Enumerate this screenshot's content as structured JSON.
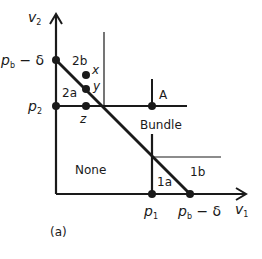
{
  "figure": {
    "caption": "(a)",
    "axes": {
      "x_label": "v",
      "x_label_sub": "1",
      "y_label": "v",
      "y_label_sub": "2"
    },
    "y_ticks": [
      {
        "label": "p",
        "sub": "b",
        "suffix": " − δ"
      },
      {
        "label": "p",
        "sub": "2",
        "suffix": ""
      }
    ],
    "x_ticks": [
      {
        "label": "p",
        "sub": "1",
        "suffix": ""
      },
      {
        "label": "p",
        "sub": "b",
        "suffix": " − δ"
      }
    ],
    "regions": {
      "r2b": "2b",
      "r2a": "2a",
      "bundle": "Bundle",
      "none": "None",
      "r1a": "1a",
      "r1b": "1b"
    },
    "points": {
      "x": "x",
      "y": "y",
      "z": "z",
      "A": "A"
    },
    "colors": {
      "line": "#1a1a1a",
      "background": "#ffffff"
    }
  }
}
